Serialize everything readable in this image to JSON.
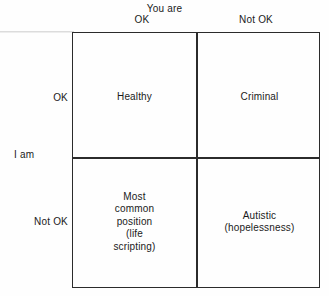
{
  "diagram": {
    "title_top": "You are",
    "title_left": "I am",
    "columns": [
      {
        "id": "ok",
        "label": "OK"
      },
      {
        "id": "not-ok",
        "label": "Not OK"
      }
    ],
    "rows": [
      {
        "id": "ok",
        "label": "OK"
      },
      {
        "id": "not-ok",
        "label": "Not OK"
      }
    ],
    "cells": {
      "top_left": "Healthy",
      "top_right": "Criminal",
      "bottom_left": "Most\ncommon\nposition\n(life\nscripting)",
      "bottom_right": "Autistic\n(hopelessness)"
    },
    "colors": {
      "line": "#2b2b2b",
      "text": "#1a1a1a",
      "background": "#fefefe"
    }
  }
}
